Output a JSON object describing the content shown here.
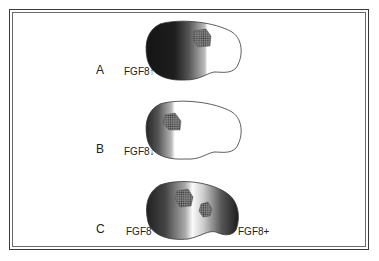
{
  "figure": {
    "panels": [
      {
        "letter": "A",
        "label": "FGF8↑",
        "description": "FGF8 increased: dark anterior gradient, marked area shifted posterior"
      },
      {
        "letter": "B",
        "label": "FGF8↓",
        "description": "FGF8 decreased: narrow anterior gradient, marked area shifted anterior"
      },
      {
        "letter": "C",
        "label_left": "FGF8",
        "label_right": "FGF8+",
        "description": "Ectopic posterior FGF8 source: duplicated marked area"
      }
    ],
    "colors": {
      "shade_dark": "#1a1a1a",
      "outline": "#333333",
      "patch": "#555555",
      "background": "#ffffff"
    }
  }
}
